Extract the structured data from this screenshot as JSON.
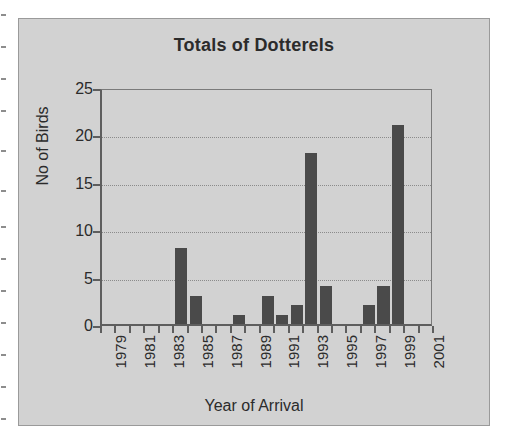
{
  "chart_data": {
    "type": "bar",
    "title": "Totals of Dotterels",
    "xlabel": "Year of Arrival",
    "ylabel": "No of Birds",
    "ylim": [
      0,
      25
    ],
    "ytick_labels": [
      "0",
      "5",
      "10",
      "15",
      "20",
      "25"
    ],
    "ytick_values": [
      0,
      5,
      10,
      15,
      20,
      25
    ],
    "grid": "horizontal-dotted",
    "legend": "none",
    "xtick_labels": [
      "1979",
      "1981",
      "1983",
      "1985",
      "1987",
      "1989",
      "1991",
      "1993",
      "1995",
      "1997",
      "1999",
      "2001"
    ],
    "categories": [
      "1979",
      "1980",
      "1981",
      "1982",
      "1983",
      "1984",
      "1985",
      "1986",
      "1987",
      "1988",
      "1989",
      "1990",
      "1991",
      "1992",
      "1993",
      "1994",
      "1995",
      "1996",
      "1997",
      "1998",
      "1999",
      "2000",
      "2001"
    ],
    "values": [
      0,
      0,
      0,
      0,
      0,
      8,
      3,
      0,
      0,
      1,
      0,
      3,
      1,
      2,
      18,
      4,
      0,
      0,
      2,
      4,
      21,
      0,
      0
    ],
    "bar_color": "#4a4a4a",
    "plot_background": "#d2d2d2",
    "axis_color": "#5e5e5e"
  },
  "figure": {
    "canvas_background": "#d2d2d2",
    "page_background": "#ffffff"
  }
}
